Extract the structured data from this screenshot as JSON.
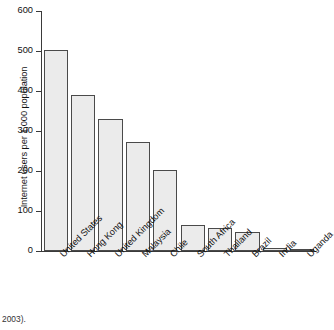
{
  "chart_data": {
    "type": "bar",
    "title": "",
    "xlabel": "",
    "ylabel": "Internet users per 1,000 population",
    "ylim": [
      0,
      600
    ],
    "ytick_labels": [
      "600",
      "500",
      "400",
      "300",
      "200",
      "100",
      "0"
    ],
    "yticks": [
      600,
      500,
      400,
      300,
      200,
      100,
      0
    ],
    "grid": false,
    "legend": null,
    "categories": [
      "United States",
      "Hong Kong",
      "United Kingdom",
      "Malaysia",
      "Chile",
      "South Africa",
      "Thailand",
      "Brazil",
      "India",
      "Uganda"
    ],
    "values": [
      502,
      389,
      330,
      273,
      202,
      66,
      57,
      47,
      7,
      3
    ],
    "bar_fill_color": "#ebebeb",
    "bar_edge_color": "#4a4a4a",
    "axis_color": "#3a3a3a"
  },
  "caption": "2003)."
}
